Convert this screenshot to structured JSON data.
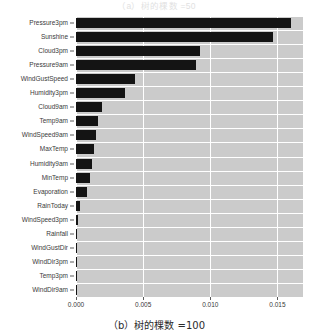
{
  "figure": {
    "top_caption_partial": "（a）树的棵数 =50",
    "bottom_caption": "（b）树的棵数 =100"
  },
  "chart_data": {
    "type": "bar",
    "orientation": "horizontal",
    "title": "",
    "xlabel": "",
    "ylabel": "",
    "xlim": [
      0.0,
      0.0169
    ],
    "xticks": [
      0.0,
      0.005,
      0.01,
      0.015
    ],
    "xtick_labels": [
      "0.000",
      "0.005",
      "0.010",
      "0.015"
    ],
    "grid": true,
    "grid_color": "#ffffff",
    "plot_bgcolor": "#cbcbcb",
    "bar_color": "#141414",
    "legend": null,
    "categories": [
      "Pressure3pm",
      "Sunshine",
      "Cloud3pm",
      "Pressure9am",
      "WindGustSpeed",
      "Humidity3pm",
      "Cloud9am",
      "Temp9am",
      "WindSpeed9am",
      "MaxTemp",
      "Humidity9am",
      "MinTemp",
      "Evaporation",
      "RainToday",
      "WindSpeed3pm",
      "Rainfall",
      "WindGustDir",
      "WindDir3pm",
      "Temp3pm",
      "WindDir9am"
    ],
    "values": [
      0.016,
      0.01465,
      0.00925,
      0.0089,
      0.00442,
      0.00366,
      0.00194,
      0.00164,
      0.00149,
      0.00134,
      0.00119,
      0.00104,
      0.00082,
      0.0003,
      0.00015,
      8e-05,
      8e-05,
      8e-05,
      8e-05,
      8e-05
    ]
  }
}
